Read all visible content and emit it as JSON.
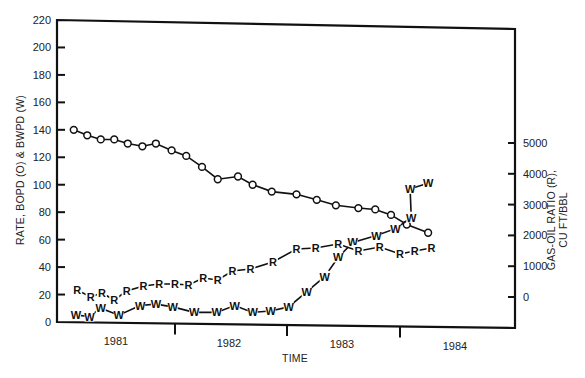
{
  "chart_data": {
    "type": "line",
    "title": "",
    "xlabel": "TIME",
    "ylabel_left": "RATE, BOPD (O) & BWPD (W)",
    "ylabel_right": [
      "GAS-OIL RATIO (R),",
      "CU FT/BBL"
    ],
    "x_categories": [
      "1981",
      "1982",
      "1983",
      "1984"
    ],
    "ylim_left": [
      0,
      220
    ],
    "yticks_left": [
      0,
      20,
      40,
      60,
      80,
      100,
      120,
      140,
      160,
      180,
      200,
      220
    ],
    "ylim_right": [
      0,
      5000
    ],
    "yticks_right": [
      0,
      1000,
      2000,
      3000,
      4000,
      5000
    ],
    "grid": false,
    "legend": "inline markers: O = oil rate, W = water rate, R = gas-oil ratio",
    "series": [
      {
        "name": "Oil rate (BOPD)",
        "marker": "O",
        "axis": "left",
        "t": [
          1980.6,
          1980.72,
          1980.84,
          1980.96,
          1981.08,
          1981.21,
          1981.33,
          1981.47,
          1981.6,
          1981.74,
          1981.88,
          1982.06,
          1982.19,
          1982.36,
          1982.58,
          1982.76,
          1982.93,
          1983.13,
          1983.28,
          1983.42,
          1983.56,
          1983.75
        ],
        "values": [
          140,
          136,
          133,
          133,
          130,
          128,
          130,
          125,
          121,
          113,
          104,
          106,
          100,
          95,
          93,
          89,
          85,
          83,
          82,
          78,
          71,
          65
        ]
      },
      {
        "name": "Water rate (BWPD)",
        "marker": "W",
        "axis": "left",
        "t": [
          1980.62,
          1980.74,
          1980.84,
          1981.0,
          1981.19,
          1981.33,
          1981.48,
          1981.67,
          1981.87,
          1982.03,
          1982.19,
          1982.35,
          1982.51,
          1982.67,
          1982.83,
          1982.95,
          1983.08,
          1983.29,
          1983.46,
          1983.6,
          1983.59,
          1983.75
        ],
        "values": [
          5,
          4,
          10,
          5,
          12,
          13,
          11,
          7,
          7,
          12,
          7,
          8,
          11,
          22,
          33,
          47,
          58,
          63,
          68,
          76,
          97,
          101
        ]
      },
      {
        "name": "Gas-oil ratio (CU FT/BBL)",
        "marker": "R",
        "axis": "right",
        "t": [
          1980.63,
          1980.75,
          1980.85,
          1980.96,
          1981.07,
          1981.22,
          1981.36,
          1981.5,
          1981.62,
          1981.75,
          1981.88,
          1982.01,
          1982.17,
          1982.37,
          1982.58,
          1982.75,
          1982.95,
          1983.13,
          1983.32,
          1983.5,
          1983.63,
          1983.78
        ],
        "values": [
          227,
          0,
          130,
          -97,
          195,
          357,
          422,
          422,
          390,
          617,
          552,
          844,
          909,
          1136,
          1558,
          1591,
          1721,
          1494,
          1623,
          1396,
          1494,
          1591
        ]
      }
    ]
  },
  "labels": {
    "x_title": "TIME",
    "y_left_title": "RATE, BOPD (O) & BWPD (W)",
    "y_right_title_line1": "GAS-OIL RATIO (R),",
    "y_right_title_line2": "CU FT/BBL"
  }
}
